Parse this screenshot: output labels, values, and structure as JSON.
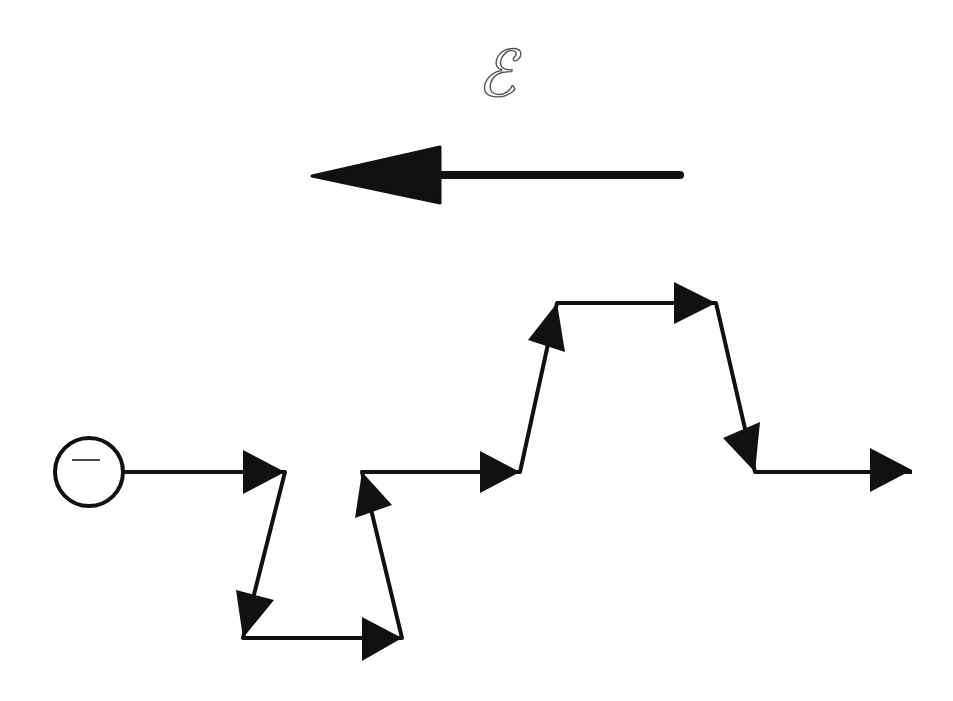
{
  "diagram": {
    "field_label": "ℰ",
    "field_label_description": "electric field symbol (script E)",
    "field_arrow": {
      "direction": "left",
      "tail": [
        680,
        175
      ],
      "head_tip": [
        312,
        175
      ]
    },
    "charge": {
      "sign": "negative",
      "symbol": "−",
      "center": [
        89,
        472
      ],
      "radius": 34
    },
    "path": {
      "description": "zig-zag displacement path of the negative charge, arrows marking each segment",
      "vertices": [
        [
          123,
          472
        ],
        [
          285,
          472
        ],
        [
          243,
          638
        ],
        [
          402,
          638
        ],
        [
          362,
          472
        ],
        [
          520,
          472
        ],
        [
          557,
          303
        ],
        [
          716,
          303
        ],
        [
          755,
          472
        ],
        [
          912,
          472
        ]
      ]
    },
    "colors": {
      "ink": "#111111",
      "background": "#ffffff",
      "label": "#555555"
    }
  }
}
